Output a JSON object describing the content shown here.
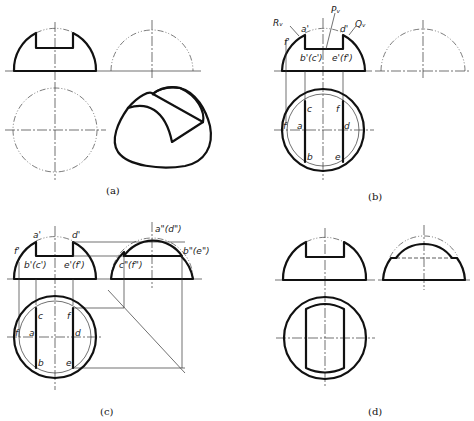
{
  "figure": {
    "panels": [
      {
        "id": "a",
        "caption": "(a)",
        "views": [
          "front-view",
          "side-view",
          "top-view",
          "isometric-view"
        ]
      },
      {
        "id": "b",
        "caption": "(b)",
        "labels": {
          "R": "Rᵥ",
          "P": "Pᵥ",
          "Q": "Qᵥ",
          "a_prime": "a'",
          "d_prime": "d'",
          "f_prime": "f'",
          "bc_prime": "b'(c')",
          "ef_prime": "e'(f')",
          "c": "c",
          "f": "f",
          "a": "a",
          "d": "d",
          "b": "b",
          "e": "e",
          "f_left": "f"
        }
      },
      {
        "id": "c",
        "caption": "(c)",
        "labels": {
          "a_prime": "a'",
          "d_prime": "d'",
          "f_prime": "f'",
          "bc_prime": "b'(c')",
          "ef_prime": "e'(f')",
          "ad_dprime": "a\"(d\")",
          "be_dprime": "b\"(e\")",
          "cf_dprime": "c\"(f\")",
          "c": "c",
          "f": "f",
          "a": "a",
          "d": "d",
          "b": "b",
          "e": "e",
          "f_left": "f"
        }
      },
      {
        "id": "d",
        "caption": "(d)",
        "views": [
          "front-view",
          "side-view",
          "top-view"
        ]
      }
    ]
  }
}
